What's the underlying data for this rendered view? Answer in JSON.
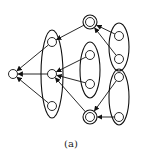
{
  "caption": "(a)",
  "colors": {
    "stroke": "#111111",
    "background": "#ffffff"
  },
  "nodes": [
    {
      "id": "n0",
      "x": 13,
      "y": 74,
      "r": 4.5,
      "double": false
    },
    {
      "id": "n1",
      "x": 52,
      "y": 42,
      "r": 4.5,
      "double": false
    },
    {
      "id": "n2",
      "x": 52,
      "y": 74,
      "r": 4.5,
      "double": false
    },
    {
      "id": "n3",
      "x": 52,
      "y": 106,
      "r": 4.5,
      "double": false
    },
    {
      "id": "n4",
      "x": 90,
      "y": 22,
      "r": 4.5,
      "double": true
    },
    {
      "id": "n5",
      "x": 90,
      "y": 55,
      "r": 4.5,
      "double": false
    },
    {
      "id": "n6",
      "x": 90,
      "y": 84,
      "r": 4.5,
      "double": false
    },
    {
      "id": "n7",
      "x": 90,
      "y": 117,
      "r": 4.5,
      "double": true
    },
    {
      "id": "n8",
      "x": 119,
      "y": 36,
      "r": 4.5,
      "double": false
    },
    {
      "id": "n9",
      "x": 119,
      "y": 59,
      "r": 4.5,
      "double": false
    },
    {
      "id": "n10",
      "x": 119,
      "y": 77,
      "r": 4.5,
      "double": false
    },
    {
      "id": "n11",
      "x": 119,
      "y": 117,
      "r": 4.5,
      "double": false
    }
  ],
  "groups": [
    {
      "id": "g1",
      "cx": 52,
      "cy": 74,
      "rx": 11,
      "ry": 44,
      "members": [
        "n1",
        "n2",
        "n3"
      ]
    },
    {
      "id": "g2",
      "cx": 90,
      "cy": 70,
      "rx": 10,
      "ry": 28,
      "members": [
        "n5",
        "n6"
      ]
    },
    {
      "id": "g3",
      "cx": 119,
      "cy": 47,
      "rx": 10,
      "ry": 24,
      "members": [
        "n8",
        "n9"
      ]
    },
    {
      "id": "g4",
      "cx": 119,
      "cy": 97,
      "rx": 10,
      "ry": 28,
      "members": [
        "n10",
        "n11"
      ]
    }
  ],
  "edges": [
    {
      "from": "n1",
      "to": "n0"
    },
    {
      "from": "n2",
      "to": "n0"
    },
    {
      "from": "n3",
      "to": "n0"
    },
    {
      "from": "n4",
      "to": "n1"
    },
    {
      "from": "n5",
      "to": "n2"
    },
    {
      "from": "n6",
      "to": "n2"
    },
    {
      "from": "n7",
      "to": "n2"
    },
    {
      "from": "n8",
      "to": "n4"
    },
    {
      "from": "n9",
      "to": "n4"
    },
    {
      "from": "n10",
      "to": "n7"
    },
    {
      "from": "n11",
      "to": "n7"
    }
  ]
}
